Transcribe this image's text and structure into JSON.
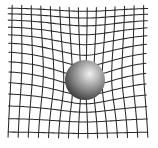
{
  "diagram": {
    "type": "spacetime-curvature",
    "background": "#ffffff",
    "grid": {
      "color": "#2a2a2a",
      "horizontal_lines": 14,
      "vertical_lines": 15,
      "x_start": 8,
      "x_end": 148,
      "y_start": 8,
      "y_end": 132,
      "well_center_x": 85,
      "well_center_y": 70,
      "well_depth": 16,
      "well_pinch": 10,
      "well_radius": 45
    },
    "sphere": {
      "cx": 85,
      "cy": 80,
      "r": 20,
      "highlight_color": "#f2f2f2",
      "mid_color": "#9a9a9a",
      "shadow_color": "#2e2e2e"
    }
  }
}
